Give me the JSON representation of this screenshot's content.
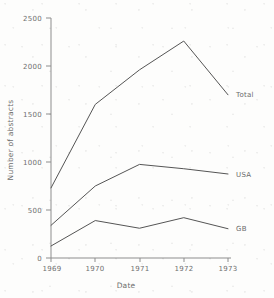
{
  "chart_data": {
    "type": "line",
    "title": "",
    "xlabel": "Date",
    "ylabel": "Number of abstracts",
    "x": [
      1969,
      1970,
      1971,
      1972,
      1973
    ],
    "xtick_labels": [
      "1969",
      "1970",
      "1971",
      "1972",
      "1973"
    ],
    "ytick_labels": [
      "0",
      "500",
      "1000",
      "1500",
      "2000",
      "2500"
    ],
    "ytick_values": [
      0,
      500,
      1000,
      1500,
      2000,
      2500
    ],
    "xlim": [
      1969,
      1973
    ],
    "ylim": [
      0,
      2500
    ],
    "grid": false,
    "legend_position": "right-inline-labels",
    "series": [
      {
        "name": "Total",
        "label": "Total",
        "color": "#555555",
        "values": [
          730,
          1600,
          1960,
          2260,
          1700
        ]
      },
      {
        "name": "USA",
        "label": "USA",
        "color": "#555555",
        "values": [
          340,
          750,
          975,
          930,
          875
        ]
      },
      {
        "name": "GB",
        "label": "GB",
        "color": "#555555",
        "values": [
          125,
          390,
          310,
          420,
          305
        ]
      }
    ]
  },
  "figure": {
    "axis_color": "#8d8d8d",
    "line_color": "#555555",
    "text_color": "#6f6f6f",
    "background": "#fdfdfc"
  }
}
